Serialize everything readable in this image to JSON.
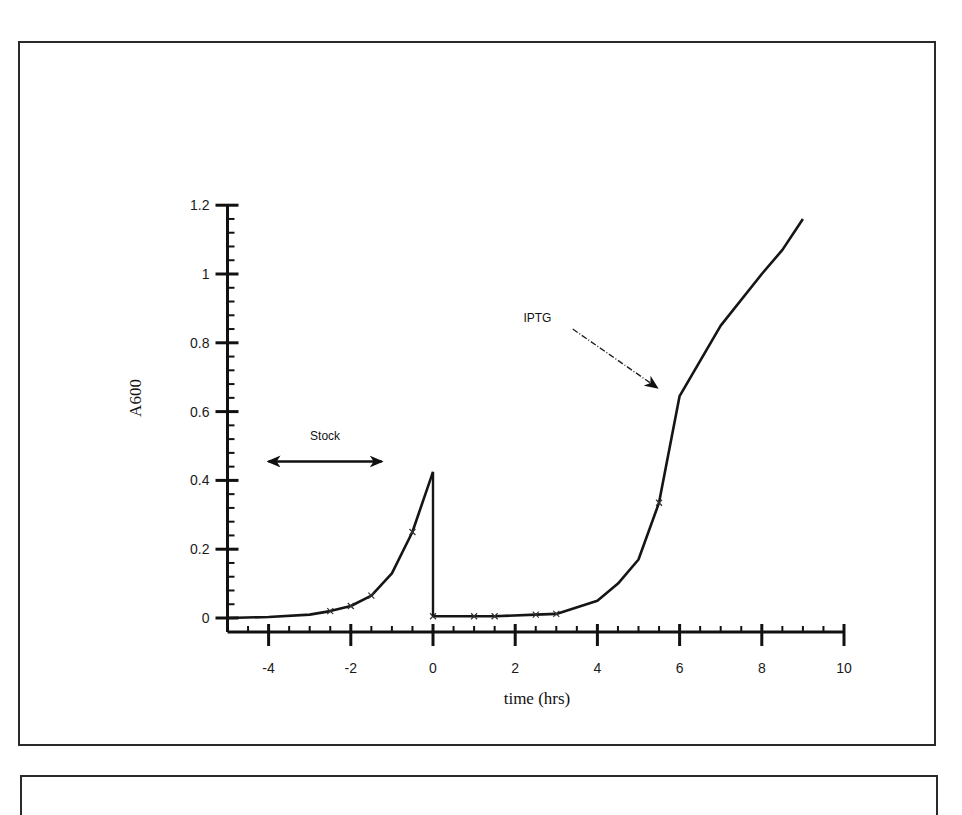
{
  "chart_data": {
    "type": "line",
    "title": "",
    "xlabel": "time (hrs)",
    "ylabel": "A600",
    "xlim": [
      -5,
      10
    ],
    "ylim": [
      0,
      1.2
    ],
    "xticks": [
      -4,
      -2,
      0,
      2,
      4,
      6,
      8,
      10
    ],
    "xtick_labels": [
      "-4",
      "-2",
      "0",
      "2",
      "4",
      "6",
      "8",
      "10"
    ],
    "yticks": [
      0,
      0.2,
      0.4,
      0.6,
      0.8,
      1.0,
      1.2
    ],
    "ytick_labels": [
      "0",
      "0.2",
      "0.4",
      "0.6",
      "0.8",
      "1",
      "1.2"
    ],
    "grid": false,
    "legend": null,
    "series": [
      {
        "name": "Stock culture",
        "x": [
          -5,
          -4,
          -3,
          -2.5,
          -2,
          -1.5,
          -1,
          -0.5,
          0
        ],
        "y": [
          0.0,
          0.003,
          0.01,
          0.02,
          0.035,
          0.065,
          0.13,
          0.25,
          0.425
        ],
        "markers_at": [
          -2.5,
          -2,
          -1.5,
          -0.5
        ]
      },
      {
        "name": "Diluted culture",
        "x": [
          0,
          1,
          1.5,
          2.5,
          3,
          4,
          4.5,
          5,
          5.5,
          6,
          7,
          8,
          8.5,
          9
        ],
        "y": [
          0.005,
          0.005,
          0.005,
          0.01,
          0.012,
          0.05,
          0.1,
          0.17,
          0.335,
          0.645,
          0.85,
          1.0,
          1.07,
          1.16
        ],
        "markers_at": [
          0,
          1,
          1.5,
          2.5,
          3,
          5.5
        ]
      }
    ],
    "drop_line": {
      "x": 0,
      "from": 0.425,
      "to": 0.005
    },
    "annotations": [
      {
        "text": "Stock",
        "type": "double-arrow",
        "x_from": -4,
        "x_to": -1.25,
        "y": 0.455
      },
      {
        "text": "IPTG",
        "type": "dashed-arrow",
        "text_x": 2.2,
        "text_y": 0.86,
        "arrow_from": [
          3.4,
          0.84
        ],
        "arrow_to": [
          5.45,
          0.67
        ]
      }
    ]
  }
}
